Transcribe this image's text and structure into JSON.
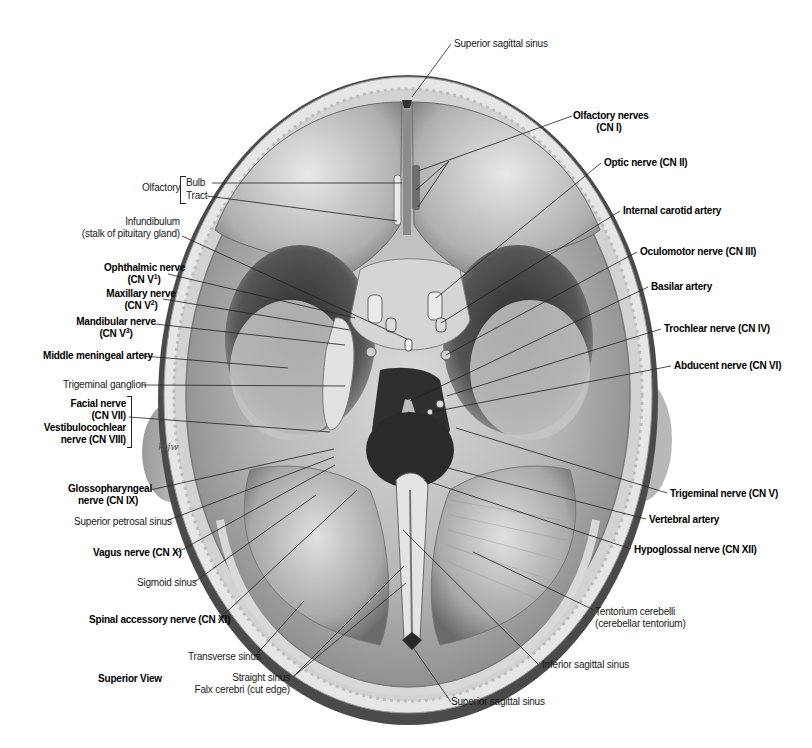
{
  "figure": {
    "view_caption": "Superior View",
    "artist_signature": "k.jw"
  },
  "labels": {
    "superior_sagittal_sinus_top": "Superior sagittal sinus",
    "olfactory_nerves": {
      "line1": "Olfactory nerves",
      "line2": "(CN I)"
    },
    "optic_nerve": "Optic nerve (CN II)",
    "internal_carotid_artery": "Internal carotid artery",
    "oculomotor_nerve": "Oculomotor nerve (CN III)",
    "basilar_artery": "Basilar artery",
    "trochlear_nerve": "Trochlear nerve (CN IV)",
    "abducent_nerve": "Abducent nerve (CN VI)",
    "trigeminal_nerve": "Trigeminal nerve (CN V)",
    "vertebral_artery": "Vertebral artery",
    "hypoglossal_nerve": "Hypoglossal nerve (CN XII)",
    "tentorium_cerebelli": {
      "line1": "Tentorium cerebelli",
      "line2": "(cerebellar tentorium)"
    },
    "inferior_sagittal_sinus": "Inferior sagittal sinus",
    "superior_sagittal_sinus_bottom": "Superior sagittal sinus",
    "olfactory_group": {
      "title": "Olfactory",
      "bulb": "Bulb",
      "tract": "Tract"
    },
    "infundibulum": {
      "line1": "Infundibulum",
      "line2": "(stalk of pituitary gland)"
    },
    "ophthalmic_nerve": {
      "line1": "Ophthalmic nerve",
      "line2_prefix": "(CN V",
      "sup": "1",
      "line2_suffix": ")"
    },
    "maxillary_nerve": {
      "line1": "Maxillary nerve",
      "line2_prefix": "(CN V",
      "sup": "2",
      "line2_suffix": ")"
    },
    "mandibular_nerve": {
      "line1": "Mandibular nerve",
      "line2_prefix": "(CN V",
      "sup": "3",
      "line2_suffix": ")"
    },
    "middle_meningeal_artery": "Middle meningeal artery",
    "trigeminal_ganglion": "Trigeminal ganglion",
    "facial_nerve": {
      "line1": "Facial nerve",
      "line2": "(CN VII)"
    },
    "vestibulocochlear_nerve": {
      "line1": "Vestibulocochlear",
      "line2": "nerve (CN VIII)"
    },
    "glossopharyngeal_nerve": {
      "line1": "Glossopharyngeal",
      "line2": "nerve (CN IX)"
    },
    "superior_petrosal_sinus": "Superior petrosal sinus",
    "vagus_nerve": "Vagus nerve (CN X)",
    "sigmoid_sinus": "Sigmoid sinus",
    "spinal_accessory_nerve": "Spinal accessory nerve (CN XI)",
    "transverse_sinus": "Transverse sinus",
    "straight_sinus": "Straight sinus",
    "falx_cerebri": "Falx cerebri (cut edge)"
  },
  "colors": {
    "background": "#ffffff",
    "label_text": "#1a1a1a",
    "leader_line": "#222222",
    "bone_light": "#e4e4e4",
    "dura_mid": "#bdbdbd",
    "shadow_dark": "#3a3a3a"
  }
}
